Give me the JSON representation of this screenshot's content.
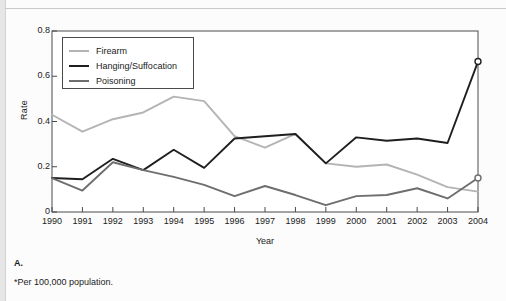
{
  "figure": {
    "panel_letter": "A.",
    "footnote": "*Per 100,000 population."
  },
  "chart_data": {
    "type": "line",
    "title": "",
    "xlabel": "Year",
    "ylabel": "Rate",
    "categories": [
      "1990",
      "1991",
      "1992",
      "1993",
      "1994",
      "1995",
      "1996",
      "1997",
      "1998",
      "1999",
      "2000",
      "2001",
      "2002",
      "2003",
      "2004"
    ],
    "x": [
      1990,
      1991,
      1992,
      1993,
      1994,
      1995,
      1996,
      1997,
      1998,
      1999,
      2000,
      2001,
      2002,
      2003,
      2004
    ],
    "xlim": [
      1990,
      2004
    ],
    "ylim": [
      0,
      0.8
    ],
    "yticks": [
      0,
      0.2,
      0.4,
      0.6,
      0.8
    ],
    "ytick_labels": [
      "0",
      "0.2",
      "0.4",
      "0.6",
      "0.8"
    ],
    "grid": false,
    "legend_position": "top-left",
    "series": [
      {
        "name": "Firearm",
        "color": "#b4b4b4",
        "values": [
          0.43,
          0.355,
          0.41,
          0.44,
          0.51,
          0.49,
          0.335,
          0.285,
          0.345,
          0.215,
          0.2,
          0.21,
          0.165,
          0.11,
          0.09
        ],
        "markers": []
      },
      {
        "name": "Hanging/Suffocation",
        "color": "#1f1f1f",
        "values": [
          0.15,
          0.145,
          0.235,
          0.185,
          0.275,
          0.195,
          0.325,
          0.335,
          0.345,
          0.215,
          0.33,
          0.315,
          0.325,
          0.305,
          0.665
        ],
        "markers": [
          {
            "x": 2004,
            "y": 0.665,
            "style": "open-circle"
          }
        ]
      },
      {
        "name": "Poisoning",
        "color": "#6e6e6e",
        "values": [
          0.15,
          0.095,
          0.22,
          0.185,
          0.155,
          0.12,
          0.07,
          0.115,
          0.075,
          0.03,
          0.07,
          0.075,
          0.105,
          0.06,
          0.15
        ],
        "markers": [
          {
            "x": 2004,
            "y": 0.15,
            "style": "open-circle"
          }
        ]
      }
    ]
  }
}
